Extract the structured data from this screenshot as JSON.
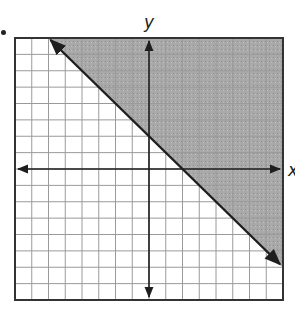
{
  "chart_data": {
    "type": "line",
    "subtype": "linear-inequality-graph",
    "title": "",
    "xlabel": "x",
    "ylabel": "y",
    "xlim": [
      -8,
      8
    ],
    "ylim": [
      -8,
      8
    ],
    "grid": true,
    "grid_step": 1,
    "boundary_line": {
      "equation": "y = -x + 2",
      "slope": -1,
      "y_intercept": 2,
      "style": "solid",
      "points": [
        [
          -6,
          8
        ],
        [
          8,
          -6
        ]
      ],
      "arrows": "both"
    },
    "inequality": "y >= -x + 2",
    "shaded_region": "above-right of line",
    "colors": {
      "shade": "#a9a9a9",
      "grid": "#9a9a9a",
      "line": "#1e1e1e",
      "border": "#333333"
    }
  },
  "labels": {
    "x_axis": "x",
    "y_axis": "y"
  }
}
